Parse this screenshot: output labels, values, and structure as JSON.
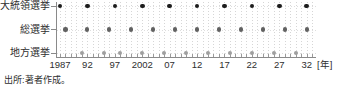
{
  "chart_data": {
    "type": "scatter",
    "title": "",
    "xlabel": "",
    "ylabel": "",
    "unit_label": "[年]",
    "x_axis": {
      "min_year": 1987,
      "max_year": 2033,
      "tick_interval_years": 1,
      "grid": "dotted-vertical-per-year",
      "tick_labels": [
        {
          "year": 1987,
          "label": "1987"
        },
        {
          "year": 1992,
          "label": "92"
        },
        {
          "year": 1997,
          "label": "97"
        },
        {
          "year": 2002,
          "label": "2002"
        },
        {
          "year": 2007,
          "label": "07"
        },
        {
          "year": 2012,
          "label": "12"
        },
        {
          "year": 2017,
          "label": "17"
        },
        {
          "year": 2022,
          "label": "22"
        },
        {
          "year": 2027,
          "label": "27"
        },
        {
          "year": 2032,
          "label": "32"
        }
      ]
    },
    "series": [
      {
        "name": "大統領選挙",
        "color": "#1c1c1c",
        "years": [
          1987,
          1992,
          1997,
          2002,
          2007,
          2012,
          2017,
          2022,
          2027,
          2032
        ]
      },
      {
        "name": "総選挙",
        "color": "#616161",
        "years": [
          1988,
          1992,
          1996,
          2000,
          2004,
          2008,
          2012,
          2016,
          2020,
          2024,
          2028,
          2032
        ]
      },
      {
        "name": "地方選挙",
        "color": "#9f9f9f",
        "years": [
          1991,
          1995,
          1998,
          2002,
          2006,
          2010,
          2014,
          2018,
          2022,
          2026,
          2030
        ]
      }
    ],
    "legend": "row-labels-left"
  },
  "source_note": "出所:著者作成。"
}
